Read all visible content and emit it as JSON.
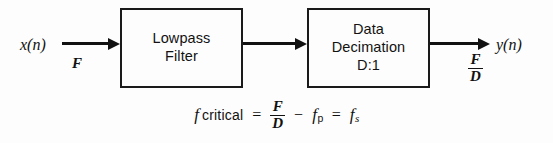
{
  "figure": {
    "kind": "block-diagram",
    "background_color": "#fdfdfd",
    "stroke_color": "#111111"
  },
  "signals": {
    "input_label": "x(n)",
    "input_rate": "F",
    "output_label": "y(n)",
    "output_rate_numerator": "F",
    "output_rate_denominator": "D"
  },
  "blocks": [
    {
      "id": "lowpass-filter",
      "line1": "Lowpass",
      "line2": "Filter",
      "line3": ""
    },
    {
      "id": "data-decimation",
      "line1": "Data",
      "line2": "Decimation",
      "line3": "D:1"
    }
  ],
  "equation": {
    "lhs_symbol": "f",
    "lhs_word": "critical",
    "equals_1": "=",
    "fraction_numerator": "F",
    "fraction_denominator": "D",
    "minus": "−",
    "term_passband_symbol": "f",
    "term_passband_subscript": "p",
    "equals_2": "=",
    "term_stopband_symbol": "f",
    "term_stopband_subscript": "s"
  }
}
